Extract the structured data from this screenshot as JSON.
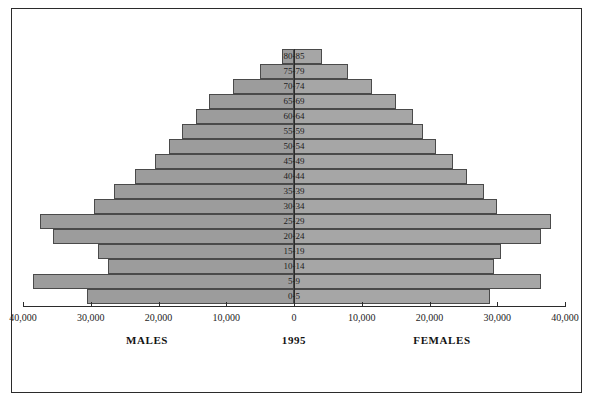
{
  "chart_data": {
    "type": "bar",
    "subtype": "population-pyramid",
    "title": "",
    "year_label": "1995",
    "xlabel": "",
    "ylabel": "",
    "xlim": [
      -40000,
      40000
    ],
    "grid": false,
    "legend_position": "none",
    "axis_ticks": [
      {
        "label": "40,000",
        "value": -40000
      },
      {
        "label": "30,000",
        "value": -30000
      },
      {
        "label": "20,000",
        "value": -20000
      },
      {
        "label": "10,000",
        "value": -10000
      },
      {
        "label": "0",
        "value": 0
      },
      {
        "label": "10,000",
        "value": 10000
      },
      {
        "label": "20,000",
        "value": 20000
      },
      {
        "label": "30,000",
        "value": 30000
      },
      {
        "label": "40,000",
        "value": 40000
      }
    ],
    "side_labels": {
      "left": "MALES",
      "right": "FEMALES"
    },
    "categories": [
      "80-85",
      "75-79",
      "70-74",
      "65-69",
      "60-64",
      "55-59",
      "50-54",
      "45-49",
      "40-44",
      "35-39",
      "30-34",
      "25-29",
      "20-24",
      "15-19",
      "10-14",
      "5-9",
      "0-5"
    ],
    "series": [
      {
        "name": "MALES",
        "color": "#9c9c9c",
        "values": [
          1800,
          5000,
          9000,
          12500,
          14500,
          16500,
          18500,
          20500,
          23500,
          26500,
          29500,
          37500,
          35500,
          29000,
          27500,
          38500,
          30500
        ]
      },
      {
        "name": "FEMALES",
        "color": "#a6a6a6",
        "values": [
          4200,
          8000,
          11500,
          15000,
          17500,
          19000,
          21000,
          23500,
          25500,
          28000,
          30000,
          38000,
          36500,
          30500,
          29500,
          36500,
          29000
        ]
      }
    ]
  },
  "meta": {
    "bar_border_color": "#4a4a4a",
    "frame_color": "#2b2b2b",
    "axis_color": "#2b2b2b",
    "background": "#ffffff"
  }
}
